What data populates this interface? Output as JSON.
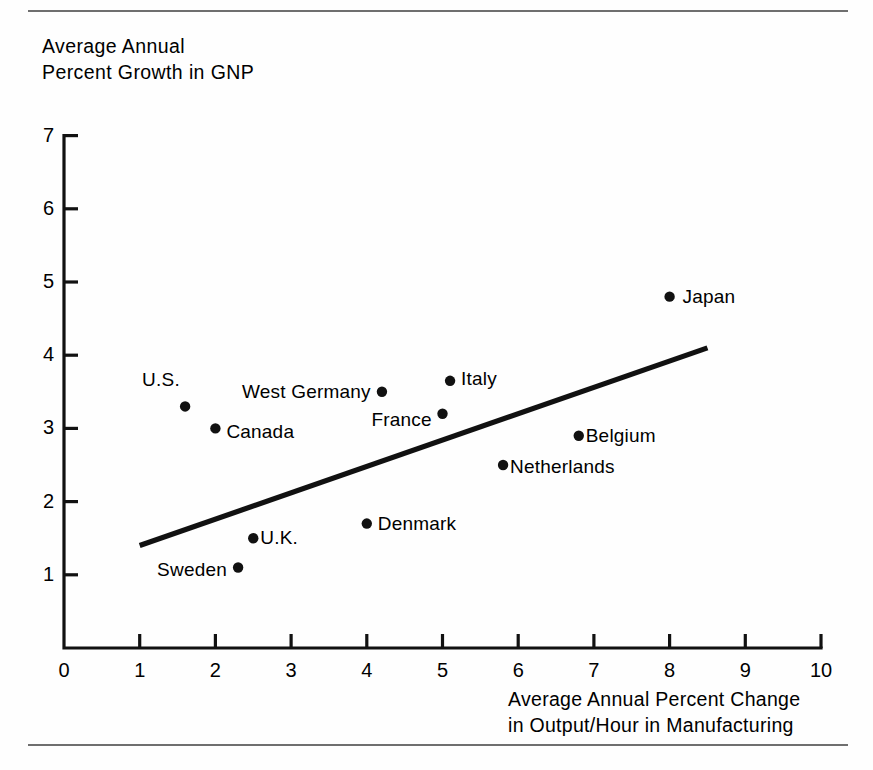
{
  "chart_data": {
    "type": "scatter",
    "title": "",
    "xlabel": "Average Annual Percent Change in Output/Hour in Manufacturing",
    "ylabel": "Average Annual Percent Growth in GNP",
    "xlim": [
      0,
      10
    ],
    "ylim": [
      0,
      7
    ],
    "xticks": [
      0,
      1,
      2,
      3,
      4,
      5,
      6,
      7,
      8,
      9,
      10
    ],
    "yticks": [
      0,
      1,
      2,
      3,
      4,
      5,
      6,
      7
    ],
    "grid": false,
    "legend": "none",
    "points": [
      {
        "label": "U.S.",
        "x": 1.6,
        "y": 3.3,
        "label_pos": "left"
      },
      {
        "label": "Canada",
        "x": 2.0,
        "y": 3.0,
        "label_pos": "right"
      },
      {
        "label": "Sweden",
        "x": 2.3,
        "y": 1.1,
        "label_pos": "left"
      },
      {
        "label": "U.K.",
        "x": 2.5,
        "y": 1.5,
        "label_pos": "right"
      },
      {
        "label": "Denmark",
        "x": 4.0,
        "y": 1.7,
        "label_pos": "right"
      },
      {
        "label": "West Germany",
        "x": 4.2,
        "y": 3.5,
        "label_pos": "left"
      },
      {
        "label": "France",
        "x": 5.0,
        "y": 3.2,
        "label_pos": "left"
      },
      {
        "label": "Italy",
        "x": 5.1,
        "y": 3.65,
        "label_pos": "right"
      },
      {
        "label": "Netherlands",
        "x": 5.8,
        "y": 2.5,
        "label_pos": "right"
      },
      {
        "label": "Belgium",
        "x": 6.8,
        "y": 2.9,
        "label_pos": "right"
      },
      {
        "label": "Japan",
        "x": 8.0,
        "y": 4.8,
        "label_pos": "right"
      }
    ],
    "trendline": {
      "x0": 1.0,
      "y0": 1.4,
      "x1": 8.5,
      "y1": 4.1
    },
    "axis_color": "#111111",
    "point_color": "#111111",
    "line_color": "#111111"
  },
  "ytitle_text": "Average Annual\nPercent Growth in GNP",
  "xtitle_text": "Average Annual Percent Change\nin Output/Hour in Manufacturing"
}
